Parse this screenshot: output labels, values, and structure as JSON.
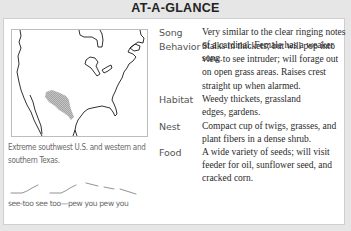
{
  "header": {
    "title": "AT-A-GLANCE"
  },
  "range_map": {
    "caption": "Extreme southwest U.S. and western and southern Texas.",
    "range_color": "#a9a9a9"
  },
  "song_sketch": {
    "caption": "see-too see too—pew you pew you"
  },
  "facts": [
    {
      "label": "Song",
      "value": "Very similar to the clear ringing notes of a cardinal. Female has a weaker song."
    },
    {
      "label": "Behavior",
      "value": "Stalks in thickets; but will pop into view to see intruder; will forage out on open grass areas. Raises crest straight up when alarmed."
    },
    {
      "label": "Habitat",
      "value": "Weedy thickets, grassland edges, gardens."
    },
    {
      "label": "Nest",
      "value": "Compact cup of twigs, grasses, and plant fibers in a dense shrub."
    },
    {
      "label": "Food",
      "value": "A wide variety of seeds; will visit feeder for oil, sunflower seed, and cracked corn."
    }
  ]
}
